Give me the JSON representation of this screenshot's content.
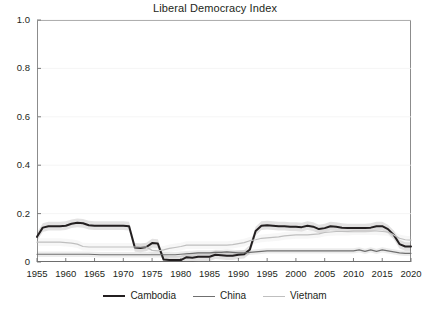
{
  "chart_data": {
    "type": "line",
    "title": "Liberal Democracy Index",
    "xlabel": "",
    "ylabel": "",
    "xlim": [
      1955,
      2020
    ],
    "ylim": [
      0,
      1.0
    ],
    "grid": true,
    "legend_position": "bottom",
    "x_ticks": [
      "1955",
      "1960",
      "1965",
      "1970",
      "1975",
      "1980",
      "1985",
      "1990",
      "1995",
      "2000",
      "2005",
      "2010",
      "2015",
      "2020"
    ],
    "y_ticks": [
      "0",
      "0.2",
      "0.4",
      "0.6",
      "0.8",
      "1.0"
    ],
    "x": [
      1955,
      1956,
      1957,
      1958,
      1959,
      1960,
      1961,
      1962,
      1963,
      1964,
      1965,
      1966,
      1967,
      1968,
      1969,
      1970,
      1971,
      1972,
      1973,
      1974,
      1975,
      1976,
      1977,
      1978,
      1979,
      1980,
      1981,
      1982,
      1983,
      1984,
      1985,
      1986,
      1987,
      1988,
      1989,
      1990,
      1991,
      1992,
      1993,
      1994,
      1995,
      1996,
      1997,
      1998,
      1999,
      2000,
      2001,
      2002,
      2003,
      2004,
      2005,
      2006,
      2007,
      2008,
      2009,
      2010,
      2011,
      2012,
      2013,
      2014,
      2015,
      2016,
      2017,
      2018,
      2019,
      2020
    ],
    "series": [
      {
        "name": "Cambodia",
        "color": "#231f20",
        "width": 2.0,
        "values": [
          0.104,
          0.142,
          0.148,
          0.148,
          0.148,
          0.15,
          0.158,
          0.162,
          0.16,
          0.152,
          0.15,
          0.15,
          0.15,
          0.15,
          0.15,
          0.15,
          0.148,
          0.06,
          0.058,
          0.062,
          0.078,
          0.076,
          0.01,
          0.008,
          0.008,
          0.008,
          0.02,
          0.018,
          0.022,
          0.022,
          0.022,
          0.03,
          0.028,
          0.026,
          0.026,
          0.03,
          0.032,
          0.052,
          0.128,
          0.15,
          0.152,
          0.15,
          0.148,
          0.148,
          0.146,
          0.146,
          0.144,
          0.15,
          0.146,
          0.136,
          0.14,
          0.148,
          0.146,
          0.142,
          0.14,
          0.14,
          0.14,
          0.14,
          0.142,
          0.148,
          0.148,
          0.136,
          0.112,
          0.074,
          0.064,
          0.064
        ],
        "band": 0.018
      },
      {
        "name": "China",
        "color": "#6f6f6f",
        "width": 1.2,
        "values": [
          0.032,
          0.032,
          0.032,
          0.032,
          0.032,
          0.032,
          0.032,
          0.032,
          0.032,
          0.032,
          0.031,
          0.03,
          0.03,
          0.03,
          0.03,
          0.03,
          0.03,
          0.03,
          0.03,
          0.03,
          0.03,
          0.03,
          0.03,
          0.03,
          0.03,
          0.032,
          0.034,
          0.036,
          0.038,
          0.038,
          0.038,
          0.04,
          0.04,
          0.042,
          0.04,
          0.038,
          0.038,
          0.04,
          0.042,
          0.044,
          0.046,
          0.046,
          0.046,
          0.046,
          0.046,
          0.046,
          0.046,
          0.046,
          0.046,
          0.046,
          0.046,
          0.046,
          0.046,
          0.046,
          0.046,
          0.046,
          0.05,
          0.044,
          0.05,
          0.044,
          0.05,
          0.046,
          0.042,
          0.038,
          0.036,
          0.036
        ],
        "band": 0.011
      },
      {
        "name": "Vietnam",
        "color": "#bfbfbf",
        "width": 1.2,
        "values": [
          0.082,
          0.082,
          0.082,
          0.082,
          0.082,
          0.08,
          0.078,
          0.074,
          0.064,
          0.062,
          0.062,
          0.062,
          0.062,
          0.062,
          0.062,
          0.062,
          0.062,
          0.062,
          0.062,
          0.062,
          0.048,
          0.046,
          0.05,
          0.056,
          0.06,
          0.064,
          0.07,
          0.07,
          0.07,
          0.07,
          0.07,
          0.07,
          0.07,
          0.07,
          0.072,
          0.076,
          0.08,
          0.088,
          0.092,
          0.098,
          0.1,
          0.102,
          0.104,
          0.108,
          0.11,
          0.112,
          0.112,
          0.112,
          0.114,
          0.116,
          0.122,
          0.124,
          0.126,
          0.126,
          0.126,
          0.128,
          0.128,
          0.128,
          0.128,
          0.128,
          0.126,
          0.124,
          0.112,
          0.098,
          0.092,
          0.09
        ],
        "band": 0.016
      }
    ]
  },
  "legend": {
    "items": [
      {
        "label": "Cambodia"
      },
      {
        "label": "China"
      },
      {
        "label": "Vietnam"
      }
    ]
  }
}
